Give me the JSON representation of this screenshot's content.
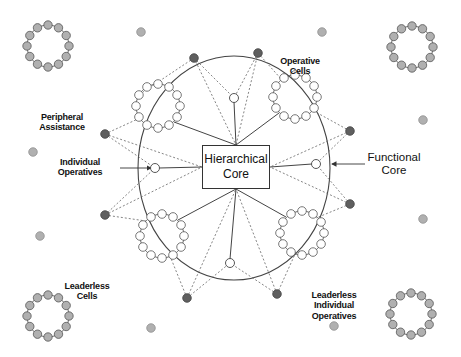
{
  "canvas": {
    "width": 461,
    "height": 357,
    "background": "#ffffff"
  },
  "colors": {
    "leader_dot": "#5f5f5f",
    "leaderless_dot": "#b0b0b0",
    "operative_node": "#ffffff",
    "stroke": "#444444",
    "dashed": "#666666"
  },
  "core": {
    "label_line1": "Hierarchical",
    "label_line2": "Core",
    "box": {
      "x": 202,
      "y": 145,
      "w": 68,
      "h": 44
    },
    "hub_top": [
      236,
      145
    ],
    "hub_bottom": [
      236,
      189
    ],
    "hub_left": [
      202,
      167
    ],
    "hub_right": [
      270,
      167
    ]
  },
  "functional_core": {
    "ellipse": {
      "cx": 234,
      "cy": 168,
      "rx": 96,
      "ry": 112
    }
  },
  "operative_cells": [
    {
      "id": "cell-top-left",
      "cx": 158,
      "cy": 106,
      "r": 22,
      "nodes": 12
    },
    {
      "id": "cell-top-right",
      "cx": 295,
      "cy": 97,
      "r": 22,
      "nodes": 12
    },
    {
      "id": "cell-bottom-left",
      "cx": 162,
      "cy": 236,
      "r": 22,
      "nodes": 12
    },
    {
      "id": "cell-bottom-right",
      "cx": 302,
      "cy": 233,
      "r": 22,
      "nodes": 12
    }
  ],
  "individual_operatives": [
    {
      "id": "op-top",
      "x": 234,
      "y": 98
    },
    {
      "id": "op-left",
      "x": 155,
      "y": 168
    },
    {
      "id": "op-right",
      "x": 316,
      "y": 164
    },
    {
      "id": "op-bottom",
      "x": 230,
      "y": 263
    }
  ],
  "peripheral_leaders": [
    {
      "id": "lead-top-left",
      "x": 194,
      "y": 58
    },
    {
      "id": "lead-top-right",
      "x": 258,
      "y": 53
    },
    {
      "id": "lead-left-upper",
      "x": 105,
      "y": 134
    },
    {
      "id": "lead-right-upper",
      "x": 350,
      "y": 131
    },
    {
      "id": "lead-left-lower",
      "x": 105,
      "y": 215
    },
    {
      "id": "lead-right-lower",
      "x": 350,
      "y": 204
    },
    {
      "id": "lead-bottom-left",
      "x": 187,
      "y": 298
    },
    {
      "id": "lead-bottom-right",
      "x": 277,
      "y": 294
    }
  ],
  "leaderless_cells": [
    {
      "id": "lc-top-left",
      "cx": 48,
      "cy": 46,
      "r": 21,
      "nodes": 12
    },
    {
      "id": "lc-top-right",
      "cx": 412,
      "cy": 47,
      "r": 21,
      "nodes": 12
    },
    {
      "id": "lc-bottom-left",
      "cx": 48,
      "cy": 316,
      "r": 21,
      "nodes": 12
    },
    {
      "id": "lc-bottom-right",
      "cx": 411,
      "cy": 314,
      "r": 21,
      "nodes": 12
    }
  ],
  "leaderless_individuals": [
    {
      "x": 141,
      "y": 32
    },
    {
      "x": 322,
      "y": 32
    },
    {
      "x": 33,
      "y": 152
    },
    {
      "x": 40,
      "y": 236
    },
    {
      "x": 423,
      "y": 120
    },
    {
      "x": 423,
      "y": 219
    },
    {
      "x": 151,
      "y": 328
    },
    {
      "x": 334,
      "y": 326
    }
  ],
  "solid_links": [
    {
      "from": "hub_top",
      "to": [
        234,
        102
      ]
    },
    {
      "from": "hub_top",
      "to": [
        174,
        122
      ]
    },
    {
      "from": "hub_top",
      "to": [
        279,
        113
      ]
    },
    {
      "from": "hub_left",
      "to": [
        159,
        168
      ]
    },
    {
      "from": "hub_right",
      "to": [
        312,
        164
      ]
    },
    {
      "from": "hub_bottom",
      "to": [
        178,
        220
      ]
    },
    {
      "from": "hub_bottom",
      "to": [
        286,
        217
      ]
    },
    {
      "from": "hub_bottom",
      "to": [
        230,
        259
      ]
    }
  ],
  "dashed_links": [
    [
      [
        194,
        58
      ],
      [
        143,
        92
      ]
    ],
    [
      [
        194,
        58
      ],
      [
        234,
        98
      ]
    ],
    [
      [
        194,
        58
      ],
      [
        236,
        145
      ]
    ],
    [
      [
        258,
        53
      ],
      [
        234,
        98
      ]
    ],
    [
      [
        258,
        53
      ],
      [
        282,
        80
      ]
    ],
    [
      [
        258,
        53
      ],
      [
        236,
        145
      ]
    ],
    [
      [
        105,
        134
      ],
      [
        140,
        118
      ]
    ],
    [
      [
        105,
        134
      ],
      [
        155,
        168
      ]
    ],
    [
      [
        105,
        134
      ],
      [
        202,
        167
      ]
    ],
    [
      [
        350,
        131
      ],
      [
        312,
        110
      ]
    ],
    [
      [
        350,
        131
      ],
      [
        316,
        164
      ]
    ],
    [
      [
        350,
        131
      ],
      [
        270,
        167
      ]
    ],
    [
      [
        105,
        215
      ],
      [
        155,
        168
      ]
    ],
    [
      [
        105,
        215
      ],
      [
        146,
        221
      ]
    ],
    [
      [
        105,
        215
      ],
      [
        202,
        167
      ]
    ],
    [
      [
        350,
        204
      ],
      [
        316,
        164
      ]
    ],
    [
      [
        350,
        204
      ],
      [
        316,
        218
      ]
    ],
    [
      [
        350,
        204
      ],
      [
        270,
        167
      ]
    ],
    [
      [
        187,
        298
      ],
      [
        230,
        263
      ]
    ],
    [
      [
        187,
        298
      ],
      [
        170,
        256
      ]
    ],
    [
      [
        187,
        298
      ],
      [
        236,
        189
      ]
    ],
    [
      [
        277,
        294
      ],
      [
        230,
        263
      ]
    ],
    [
      [
        277,
        294
      ],
      [
        296,
        252
      ]
    ],
    [
      [
        277,
        294
      ],
      [
        236,
        189
      ]
    ]
  ],
  "arrows": [
    {
      "id": "arrow-individual-operatives",
      "from": [
        120,
        168
      ],
      "to": [
        151,
        168
      ]
    },
    {
      "id": "arrow-functional-core",
      "from": [
        365,
        164
      ],
      "to": [
        332,
        164
      ]
    }
  ],
  "labels": [
    {
      "id": "label-operative-cells",
      "lines": [
        "Operative",
        "Cells"
      ],
      "x": 300,
      "y": 56,
      "size": "small"
    },
    {
      "id": "label-peripheral-assistance",
      "lines": [
        "Peripheral",
        "Assistance"
      ],
      "x": 62,
      "y": 112,
      "size": "small"
    },
    {
      "id": "label-individual-operatives",
      "lines": [
        "Individual",
        "Operatives"
      ],
      "x": 80,
      "y": 157,
      "size": "small"
    },
    {
      "id": "label-functional-core",
      "lines": [
        "Functional",
        "Core"
      ],
      "x": 394,
      "y": 151,
      "size": "big"
    },
    {
      "id": "label-leaderless-cells",
      "lines": [
        "Leaderless",
        "Cells"
      ],
      "x": 87,
      "y": 281,
      "size": "small"
    },
    {
      "id": "label-leaderless-individual-operatives",
      "lines": [
        "Leaderless",
        "Individual",
        "Operatives"
      ],
      "x": 334,
      "y": 290,
      "size": "small"
    }
  ]
}
